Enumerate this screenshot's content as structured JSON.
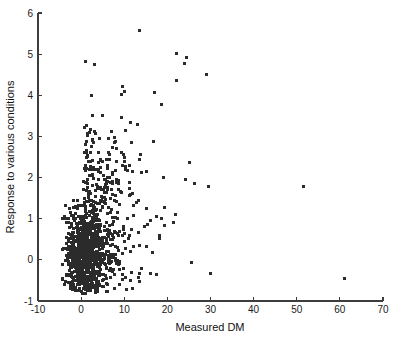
{
  "figure": {
    "background_color": "#ffffff",
    "axis_color": "#3d3d3d",
    "point_color": "#2b2b2b",
    "text_color": "#111111"
  },
  "chart_data": {
    "type": "scatter",
    "title": "",
    "xlabel": "Measured DM",
    "ylabel": "Response to various conditions",
    "xlim": [
      -10,
      70
    ],
    "ylim": [
      -1,
      6
    ],
    "xticks": [
      -10,
      0,
      10,
      20,
      30,
      40,
      50,
      60,
      70
    ],
    "yticks": [
      -1,
      0,
      1,
      2,
      3,
      4,
      5,
      6
    ],
    "xtick_labels": [
      "-10",
      "0",
      "10",
      "20",
      "30",
      "40",
      "50",
      "60",
      "70"
    ],
    "ytick_labels": [
      "-1",
      "0",
      "1",
      "2",
      "3",
      "4",
      "5",
      "6"
    ],
    "grid": false,
    "legend": null,
    "marker": "square",
    "marker_size_px": 3,
    "marker_color": "#2b2b2b",
    "n_points_approx": 1100,
    "points": [
      [
        13.5,
        5.58
      ],
      [
        22.1,
        5.02
      ],
      [
        24.5,
        4.93
      ],
      [
        23.9,
        4.77
      ],
      [
        22.2,
        4.37
      ],
      [
        29.1,
        4.5
      ],
      [
        1.1,
        4.81
      ],
      [
        3.0,
        4.75
      ],
      [
        2.5,
        4.0
      ],
      [
        9.6,
        4.22
      ],
      [
        10.1,
        4.1
      ],
      [
        9.4,
        4.02
      ],
      [
        17.0,
        4.07
      ],
      [
        18.6,
        3.77
      ],
      [
        5.0,
        3.52
      ],
      [
        9.3,
        3.46
      ],
      [
        11.4,
        3.35
      ],
      [
        13.1,
        3.3
      ],
      [
        2.1,
        3.17
      ],
      [
        3.2,
        3.12
      ],
      [
        1.2,
        2.88
      ],
      [
        2.6,
        2.92
      ],
      [
        4.3,
        2.95
      ],
      [
        6.3,
        2.95
      ],
      [
        8.0,
        2.87
      ],
      [
        11.6,
        2.86
      ],
      [
        16.7,
        2.88
      ],
      [
        2.3,
        2.76
      ],
      [
        7.3,
        2.72
      ],
      [
        8.3,
        2.7
      ],
      [
        4.0,
        2.62
      ],
      [
        6.4,
        2.62
      ],
      [
        9.3,
        2.6
      ],
      [
        13.8,
        2.55
      ],
      [
        13.5,
        2.43
      ],
      [
        8.2,
        2.4
      ],
      [
        25.2,
        2.36
      ],
      [
        9.6,
        2.3
      ],
      [
        10.2,
        2.27
      ],
      [
        10.4,
        2.2
      ],
      [
        10.8,
        2.18
      ],
      [
        1.0,
        2.3
      ],
      [
        2.2,
        2.28
      ],
      [
        2.6,
        2.2
      ],
      [
        3.3,
        2.2
      ],
      [
        2.0,
        2.04
      ],
      [
        19.0,
        2.01
      ],
      [
        24.3,
        1.95
      ],
      [
        5.4,
        1.95
      ],
      [
        6.0,
        1.9
      ],
      [
        11.3,
        1.88
      ],
      [
        26.2,
        1.85
      ],
      [
        29.5,
        1.78
      ],
      [
        51.5,
        1.79
      ],
      [
        4.5,
        1.77
      ],
      [
        5.1,
        1.72
      ],
      [
        6.0,
        1.7
      ],
      [
        0.6,
        1.7
      ],
      [
        9.1,
        1.66
      ],
      [
        11.9,
        1.62
      ],
      [
        11.5,
        1.6
      ],
      [
        7.2,
        1.58
      ],
      [
        7.9,
        1.56
      ],
      [
        13.4,
        1.44
      ],
      [
        12.9,
        1.4
      ],
      [
        19.3,
        1.28
      ],
      [
        21.9,
        1.11
      ],
      [
        21.4,
        0.92
      ],
      [
        17.5,
        1.05
      ],
      [
        16.0,
        0.95
      ],
      [
        15.5,
        0.85
      ],
      [
        14.6,
        0.8
      ],
      [
        18.1,
        0.6
      ],
      [
        16.5,
        0.17
      ],
      [
        13.4,
        -0.42
      ],
      [
        25.5,
        -0.07
      ],
      [
        29.9,
        -0.32
      ],
      [
        61.0,
        -0.45
      ],
      [
        12.2,
        0.33
      ],
      [
        11.1,
        0.52
      ],
      [
        10.0,
        0.45
      ],
      [
        9.0,
        0.7
      ],
      [
        8.5,
        0.3
      ],
      [
        7.5,
        0.05
      ],
      [
        6.9,
        -0.2
      ],
      [
        9.5,
        -0.35
      ],
      [
        11.5,
        -0.5
      ]
    ]
  }
}
